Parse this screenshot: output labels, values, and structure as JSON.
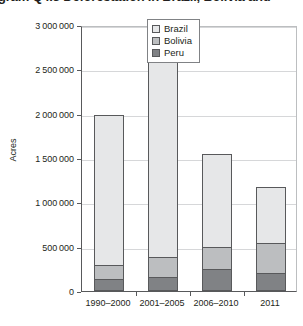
{
  "caption": {
    "text": "gram Q4.3 Deforestation in Brazil, Bolivia and"
  },
  "legend": {
    "position": "top-right",
    "items": [
      {
        "label": "Brazil",
        "swatch": "legend-swatch-brazil",
        "color": "#e6e7e8"
      },
      {
        "label": "Bolivia",
        "swatch": "legend-swatch-bolivia",
        "color": "#bcbec0"
      },
      {
        "label": "Peru",
        "swatch": "legend-swatch-peru",
        "color": "#808285"
      }
    ]
  },
  "chart_data": {
    "type": "bar",
    "stacked": true,
    "title": "",
    "xlabel": "",
    "ylabel": "Acres",
    "ylim": [
      0,
      3000000
    ],
    "grid": true,
    "categories": [
      "1990–2000",
      "2001–2005",
      "2006–2010",
      "2011"
    ],
    "ytick_labels": [
      "0",
      "500 000",
      "1 000 000",
      "1 500 000",
      "2 000 000",
      "2 500 000",
      "3 000 000"
    ],
    "ytick_values": [
      0,
      500000,
      1000000,
      1500000,
      2000000,
      2500000,
      3000000
    ],
    "series": [
      {
        "name": "Peru",
        "color": "#808285",
        "values": [
          130000,
          160000,
          250000,
          200000
        ]
      },
      {
        "name": "Bolivia",
        "color": "#bcbec0",
        "values": [
          160000,
          225000,
          250000,
          340000
        ]
      },
      {
        "name": "Brazil",
        "color": "#e6e7e8",
        "values": [
          1700000,
          2275000,
          1050000,
          630000
        ]
      }
    ],
    "totals": [
      1990000,
      2660000,
      1550000,
      1170000
    ]
  }
}
